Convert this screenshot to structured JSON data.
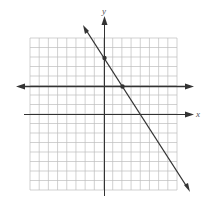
{
  "diagram": {
    "type": "coordinate-plane",
    "axis_labels": {
      "x": "x",
      "y": "y"
    },
    "grid": {
      "x_min": -8,
      "x_max": 8,
      "y_min": -8,
      "y_max": 8
    },
    "lines": [
      {
        "name": "slanted-line",
        "equation": "y = -1.5x + 6",
        "points": [
          [
            0,
            6
          ],
          [
            2,
            3
          ]
        ]
      },
      {
        "name": "horizontal-line",
        "equation": "y = 3"
      }
    ],
    "marked_points": [
      [
        0,
        6
      ],
      [
        2,
        3
      ]
    ],
    "colors": {
      "grid": "#bdbdbd",
      "axis": "#333333",
      "line": "#333333"
    }
  }
}
